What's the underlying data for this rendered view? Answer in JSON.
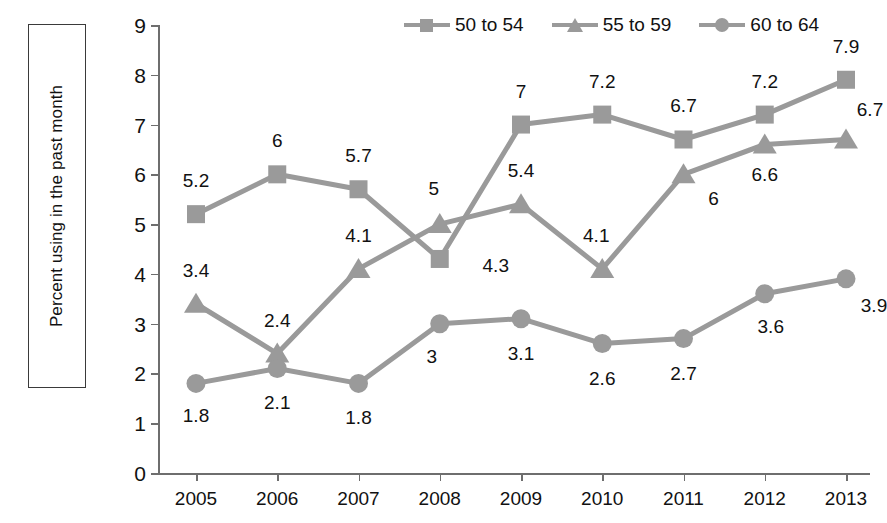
{
  "chart_data": {
    "type": "line",
    "title": "",
    "xlabel": "",
    "ylabel": "Percent using in the past month",
    "ylim": [
      0,
      9
    ],
    "ytick_labels": [
      "0",
      "1",
      "2",
      "3",
      "4",
      "5",
      "6",
      "7",
      "8",
      "9"
    ],
    "grid": false,
    "legend_position": "top-right",
    "marker_color": "#9a9a9a",
    "line_color": "#9a9a9a",
    "categories": [
      "2005",
      "2006",
      "2007",
      "2008",
      "2009",
      "2010",
      "2011",
      "2012",
      "2013"
    ],
    "series": [
      {
        "name": "50 to 54",
        "marker": "square",
        "values": [
          5.2,
          6,
          5.7,
          4.3,
          7,
          7.2,
          6.7,
          7.2,
          7.9
        ],
        "labels": [
          "5.2",
          "6",
          "5.7",
          "4.3",
          "7",
          "7.2",
          "6.7",
          "7.2",
          "7.9"
        ]
      },
      {
        "name": "55 to 59",
        "marker": "triangle",
        "values": [
          3.4,
          2.4,
          4.1,
          5,
          5.4,
          4.1,
          6,
          6.6,
          6.7
        ],
        "labels": [
          "3.4",
          "2.4",
          "4.1",
          "5",
          "5.4",
          "4.1",
          "6",
          "6.6",
          "6.7"
        ]
      },
      {
        "name": "60 to 64",
        "marker": "circle",
        "values": [
          1.8,
          2.1,
          1.8,
          3,
          3.1,
          2.6,
          2.7,
          3.6,
          3.9
        ],
        "labels": [
          "1.8",
          "2.1",
          "1.8",
          "3",
          "3.1",
          "2.6",
          "2.7",
          "3.6",
          "3.9"
        ]
      }
    ],
    "label_offsets": [
      [
        [
          0,
          -34
        ],
        [
          0,
          -34
        ],
        [
          0,
          -34
        ],
        [
          56,
          6
        ],
        [
          0,
          -34
        ],
        [
          0,
          -34
        ],
        [
          0,
          -34
        ],
        [
          0,
          -34
        ],
        [
          0,
          -34
        ]
      ],
      [
        [
          0,
          -34
        ],
        [
          0,
          -34
        ],
        [
          0,
          -34
        ],
        [
          -6,
          -36
        ],
        [
          0,
          -34
        ],
        [
          -6,
          -34
        ],
        [
          30,
          24
        ],
        [
          0,
          30
        ],
        [
          24,
          -30
        ]
      ],
      [
        [
          0,
          32
        ],
        [
          0,
          34
        ],
        [
          0,
          34
        ],
        [
          -8,
          32
        ],
        [
          0,
          34
        ],
        [
          0,
          34
        ],
        [
          0,
          34
        ],
        [
          6,
          32
        ],
        [
          28,
          26
        ]
      ]
    ]
  }
}
